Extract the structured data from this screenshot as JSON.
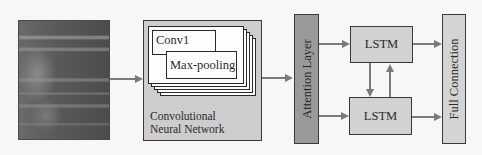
{
  "diagram": {
    "input": {
      "name": "spectrogram-input-image"
    },
    "cnn": {
      "label_line1": "Convolutional",
      "label_line2": "Neural Network",
      "conv_label": "Conv1",
      "pool_label": "Max-pooling"
    },
    "attention": {
      "label": "Attention Layer"
    },
    "lstm_top": {
      "label": "LSTM"
    },
    "lstm_bottom": {
      "label": "LSTM"
    },
    "full_connection": {
      "label": "Full Connection"
    },
    "colors": {
      "background": "#f7f7f7",
      "cnn_fill": "#cdcdcd",
      "attention_fill": "#9a9a9a",
      "lstm_fill": "#d2d2d2",
      "fc_fill": "#d4d4d4",
      "arrow": "#7a7a7a",
      "border": "#3a3a3a"
    }
  }
}
